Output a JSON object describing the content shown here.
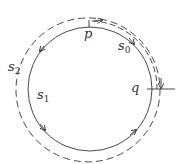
{
  "diagram": {
    "colors": {
      "stroke": "#333333",
      "background": "#ffffff"
    },
    "labels": {
      "p": {
        "base": "p",
        "sub": ""
      },
      "q": {
        "base": "q",
        "sub": ""
      },
      "s0": {
        "base": "s",
        "sub": "0"
      },
      "s1": {
        "base": "s",
        "sub": "1"
      },
      "s2": {
        "base": "s",
        "sub": "2"
      }
    },
    "elements": [
      {
        "id": "circle",
        "style": "solid",
        "description": "closed loop s1 through p and q, arrows counter-clockwise"
      },
      {
        "id": "s0-path",
        "style": "dashed",
        "description": "path s0 from p to q along upper-right arc"
      },
      {
        "id": "s2-path",
        "style": "dashed",
        "description": "outer path s2 around full loop"
      },
      {
        "id": "q-crossline",
        "style": "solid",
        "description": "horizontal line crossing circle at q"
      }
    ]
  }
}
